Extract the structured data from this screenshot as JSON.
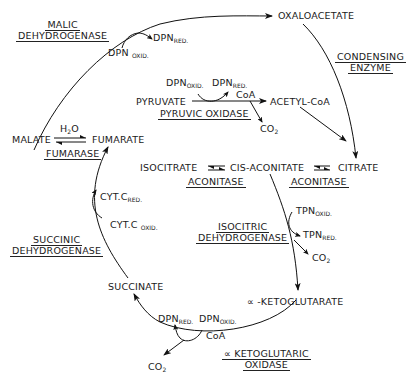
{
  "metabolites": {
    "oxaloacetate": "OXALOACETATE",
    "pyruvate": "PYRUVATE",
    "acetyl_coa": "ACETYL-CoA",
    "citrate": "CITRATE",
    "cis_aconitate": "CIS-ACONITATE",
    "isocitrate": "ISOCITRATE",
    "alpha_ketoglutarate": "∝ -KETOGLUTARATE",
    "succinate": "SUCCINATE",
    "fumarate": "FUMARATE",
    "malate": "MALATE"
  },
  "enzymes": {
    "malic_dehydrogenase": [
      "MALIC",
      "DEHYDROGENASE"
    ],
    "condensing_enzyme": [
      "CONDENSING",
      "ENZYME"
    ],
    "pyruvic_oxidase": "PYRUVIC OXIDASE",
    "fumarase": "FUMARASE",
    "aconitase_left": "ACONITASE",
    "aconitase_right": "ACONITASE",
    "isocitric_dehydrogenase": [
      "ISOCITRIC",
      "DEHYDROGENASE"
    ],
    "succinic_dehydrogenase": [
      "SUCCINIC",
      "DEHYDROGENASE"
    ],
    "alpha_ketoglutaric_oxidase": [
      "∝ KETOGLUTARIC",
      "OXIDASE"
    ]
  },
  "cofactors": {
    "dpn": "DPN",
    "tpn": "TPN",
    "cyt_c": "CYT.C",
    "oxid": "OXID.",
    "red": "RED.",
    "coa": "CoA",
    "co": "CO",
    "two": "2",
    "h": "H",
    "o": "O"
  }
}
